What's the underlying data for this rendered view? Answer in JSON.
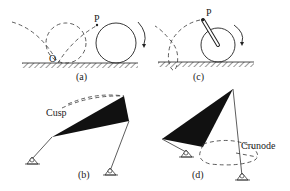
{
  "panels": {
    "a": {
      "caption": "(a)",
      "point_P": "P",
      "point_O": "O"
    },
    "b": {
      "caption": "(b)",
      "annotation": "Cusp"
    },
    "c": {
      "caption": "(c)",
      "point_P": "P"
    },
    "d": {
      "caption": "(d)",
      "annotation": "Crunode"
    }
  },
  "colors": {
    "ink": "#222222",
    "link_fill": "#111111",
    "background": "#ffffff"
  }
}
